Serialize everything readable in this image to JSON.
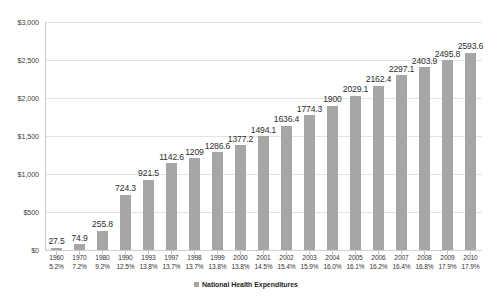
{
  "chart_data": {
    "type": "bar",
    "title": "",
    "subtitle": "",
    "xlabel": "",
    "ylabel": "",
    "grid": true,
    "legend_position": "bottom",
    "ylim": [
      0,
      3000
    ],
    "ytick_labels": [
      "$3,000",
      "$2,500",
      "$2,000",
      "$1,500",
      "$1,000",
      "$500",
      "$0"
    ],
    "ytick_values": [
      3000,
      2500,
      2000,
      1500,
      1000,
      500,
      0
    ],
    "categories": [
      "1960",
      "1970",
      "1980",
      "1990",
      "1993",
      "1997",
      "1998",
      "1999",
      "2000",
      "2001",
      "2002",
      "2003",
      "2004",
      "2005",
      "2006",
      "2007",
      "2008",
      "2009",
      "2010"
    ],
    "secondary_labels": [
      "5.2%",
      "7.2%",
      "9.2%",
      "12.5%",
      "13.8%",
      "13.7%",
      "13.7%",
      "13.8%",
      "13.8%",
      "14.5%",
      "15.4%",
      "15.9%",
      "16.0%",
      "16.1%",
      "16.2%",
      "16.4%",
      "16.8%",
      "17.9%",
      "17.9%"
    ],
    "values": [
      27.5,
      74.9,
      255.8,
      724.3,
      921.5,
      1142.6,
      1209,
      1286.6,
      1377.2,
      1494.1,
      1636.4,
      1774.3,
      1900,
      2029.1,
      2162.4,
      2297.1,
      2403.9,
      2495.8,
      2593.6
    ],
    "value_labels": [
      "27.5",
      "74.9",
      "255.8",
      "724.3",
      "921.5",
      "1142.6",
      "1209",
      "1286.6",
      "1377.2",
      "1494.1",
      "1636.4",
      "1774.3",
      "1900",
      "2029.1",
      "2162.4",
      "2297.1",
      "2403.9",
      "2495.8",
      "2593.6"
    ],
    "series": [
      {
        "name": "National Health Expenditures",
        "color": "#a6a6a6",
        "values": [
          27.5,
          74.9,
          255.8,
          724.3,
          921.5,
          1142.6,
          1209,
          1286.6,
          1377.2,
          1494.1,
          1636.4,
          1774.3,
          1900,
          2029.1,
          2162.4,
          2297.1,
          2403.9,
          2495.8,
          2593.6
        ]
      }
    ],
    "legend": [
      "National Health Expenditures"
    ]
  },
  "legend": {
    "items": [
      {
        "label": "National Health Expenditures",
        "color": "#a6a6a6"
      }
    ]
  },
  "colors": {
    "bar": "#a6a6a6",
    "grid": "#e4e4e4",
    "axis": "#c8c8c8",
    "text": "#333333",
    "background": "#ffffff"
  }
}
